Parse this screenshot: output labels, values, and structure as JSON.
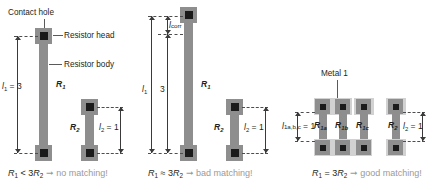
{
  "figure": {
    "type": "diagram",
    "panels": [
      {
        "id": "left",
        "annotations": [
          {
            "name": "contact-hole",
            "text": "Contact hole"
          },
          {
            "name": "resistor-head",
            "text": "Resistor head"
          },
          {
            "name": "resistor-body",
            "text": "Resistor body"
          }
        ],
        "dimensions": [
          {
            "name": "l1",
            "symbol": "l",
            "sub": "1",
            "value": "3",
            "text": "l₁ = 3"
          },
          {
            "name": "l2",
            "symbol": "l",
            "sub": "2",
            "value": "1",
            "text": "l₂ = 1"
          }
        ],
        "resistors": [
          {
            "name": "R1",
            "label": "R",
            "sub": "1"
          },
          {
            "name": "R2",
            "label": "R",
            "sub": "2"
          }
        ],
        "caption": {
          "expr_lhs": "R",
          "expr_lhs_sub": "1",
          "relation": "<",
          "expr_rhs": "3R",
          "expr_rhs_sub": "2",
          "arrow": "→",
          "verdict": "no matching!",
          "full": "R₁ < 3R₂ → no matching!"
        }
      },
      {
        "id": "middle",
        "annotations": [
          {
            "name": "l-corr",
            "symbol": "l",
            "sub": "corr",
            "text": "l_corr"
          }
        ],
        "dimensions": [
          {
            "name": "l1",
            "symbol": "l",
            "sub": "1",
            "value": "",
            "text": "l₁"
          },
          {
            "name": "nominal-3",
            "text": "3"
          },
          {
            "name": "l2",
            "symbol": "l",
            "sub": "2",
            "value": "1",
            "text": "l₂ = 1"
          }
        ],
        "resistors": [
          {
            "name": "R1",
            "label": "R",
            "sub": "1"
          },
          {
            "name": "R2",
            "label": "R",
            "sub": "2"
          }
        ],
        "caption": {
          "expr_lhs": "R",
          "expr_lhs_sub": "1",
          "relation": "≈",
          "expr_rhs": "3R",
          "expr_rhs_sub": "2",
          "arrow": "→",
          "verdict": "bad matching!",
          "full": "R₁ ≈ 3R₂ → bad matching!"
        }
      },
      {
        "id": "right",
        "annotations": [
          {
            "name": "metal-1",
            "text": "Metal 1"
          }
        ],
        "dimensions": [
          {
            "name": "l1abc",
            "symbol": "l",
            "sub": "1a,b,c",
            "value": "1",
            "text": "l₁ₐ,ᵇ,ᶜ = 1"
          },
          {
            "name": "l2",
            "symbol": "l",
            "sub": "2",
            "value": "1",
            "text": "l₂ = 1"
          }
        ],
        "resistors": [
          {
            "name": "R1a",
            "label": "R",
            "sub": "1a"
          },
          {
            "name": "R1b",
            "label": "R",
            "sub": "1b"
          },
          {
            "name": "R1c",
            "label": "R",
            "sub": "1c"
          },
          {
            "name": "R2",
            "label": "R",
            "sub": "2"
          }
        ],
        "caption": {
          "expr_lhs": "R",
          "expr_lhs_sub": "1",
          "relation": "=",
          "expr_rhs": "3R",
          "expr_rhs_sub": "2",
          "arrow": "→",
          "verdict": "good matching!",
          "full": "R₁ = 3R₂ → good matching!"
        }
      }
    ],
    "colors": {
      "background": "#ffffff",
      "resistor_gray": "#8e8e8e",
      "contact_black": "#1a1a1a",
      "metal_light": "#d2d2d2",
      "text": "#231f20",
      "verdict_gray": "#9a9a9a",
      "dimension_line": "#3a3a3a"
    }
  }
}
